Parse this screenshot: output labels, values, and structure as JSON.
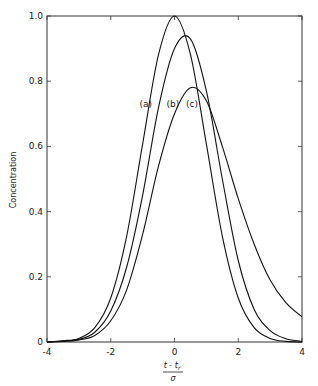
{
  "chart_data": {
    "type": "line",
    "title": "",
    "xlabel": "(t - t_r) / σ",
    "xlabel_num": "t - t",
    "xlabel_sub": "r",
    "xlabel_den": "σ",
    "ylabel": "Concentration",
    "xlim": [
      -4,
      4
    ],
    "ylim": [
      0,
      1.0
    ],
    "x_ticks": [
      -4,
      -2,
      0,
      2,
      4
    ],
    "x_tick_labels": [
      "-4",
      "-2",
      "0",
      "2",
      "4"
    ],
    "y_ticks": [
      0,
      0.2,
      0.4,
      0.6,
      0.8,
      1.0
    ],
    "y_tick_labels": [
      "0",
      "0.2",
      "0.4",
      "0.6",
      "0.8",
      "1.0"
    ],
    "grid": false,
    "legend": "none",
    "x": [
      -4,
      -3.5,
      -3,
      -2.5,
      -2,
      -1.5,
      -1,
      -0.5,
      0,
      0.5,
      1,
      1.5,
      2,
      2.5,
      3,
      3.5,
      4
    ],
    "series": [
      {
        "name": "(a)",
        "values": [
          0.0,
          0.004,
          0.011,
          0.044,
          0.135,
          0.325,
          0.607,
          0.882,
          1.0,
          0.882,
          0.607,
          0.325,
          0.135,
          0.044,
          0.011,
          0.002,
          0.0
        ]
      },
      {
        "name": "(b)",
        "values": [
          0.0,
          0.003,
          0.008,
          0.03,
          0.095,
          0.23,
          0.45,
          0.72,
          0.9,
          0.93,
          0.77,
          0.5,
          0.25,
          0.1,
          0.035,
          0.01,
          0.002
        ]
      },
      {
        "name": "(c)",
        "values": [
          0.0,
          0.002,
          0.006,
          0.02,
          0.065,
          0.16,
          0.33,
          0.54,
          0.7,
          0.78,
          0.74,
          0.6,
          0.44,
          0.3,
          0.19,
          0.12,
          0.077
        ]
      }
    ],
    "annotations": [
      {
        "text": "(a)",
        "x": -0.9,
        "y": 0.72
      },
      {
        "text": "(b)",
        "x": -0.05,
        "y": 0.72
      },
      {
        "text": "(c)",
        "x": 0.55,
        "y": 0.72
      }
    ]
  }
}
